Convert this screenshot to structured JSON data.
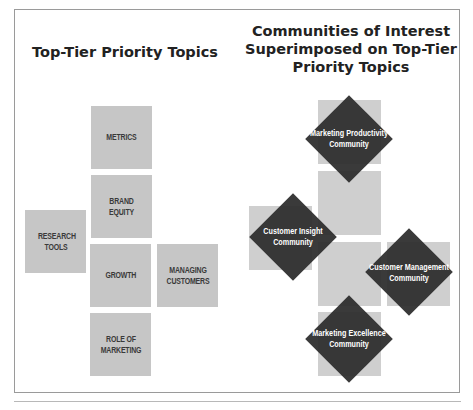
{
  "left_panel": {
    "title": "Top-Tier Priority Topics",
    "topics": [
      {
        "label": "METRICS"
      },
      {
        "label": "BRAND EQUITY"
      },
      {
        "label": "RESEARCH TOOLS"
      },
      {
        "label": "GROWTH"
      },
      {
        "label": "MANAGING CUSTOMERS"
      },
      {
        "label": "ROLE OF MARKETING"
      }
    ]
  },
  "right_panel": {
    "title_line1": "Communities of Interest",
    "title_line2": "Superimposed on Top-Tier",
    "title_line3": "Priority Topics",
    "communities": [
      {
        "line1": "Marketing Productivity",
        "line2": "Community"
      },
      {
        "line1": "Customer Insight",
        "line2": "Community"
      },
      {
        "line1": "Customer Management",
        "line2": "Community"
      },
      {
        "line1": "Marketing Excellence",
        "line2": "Community"
      }
    ]
  },
  "colors": {
    "topic_box": "#c6c6c6",
    "topic_box_light": "#cfcfcf",
    "community_diamond": "#2b2b2b",
    "frame": "#9a9a9a"
  }
}
